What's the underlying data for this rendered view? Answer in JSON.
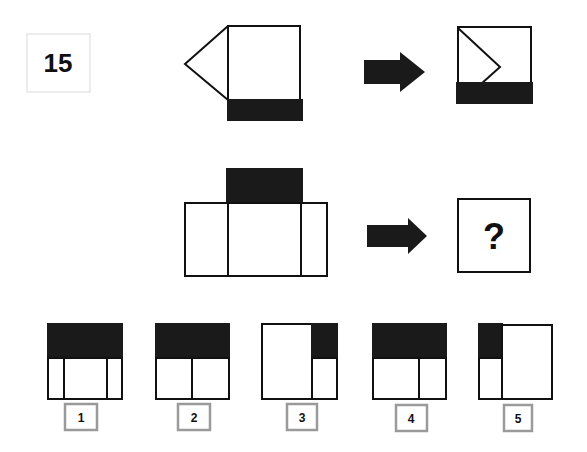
{
  "question": {
    "number": "15"
  },
  "example": {
    "description": "Square with left triangle and black bar below transforms into square with triangle folded inside and black bar below"
  },
  "problem": {
    "missing_symbol": "?"
  },
  "options": [
    {
      "label": "1"
    },
    {
      "label": "2"
    },
    {
      "label": "3"
    },
    {
      "label": "4"
    },
    {
      "label": "5"
    }
  ],
  "colors": {
    "fill_dark": "#1a1a1a",
    "stroke": "#111111",
    "label_border": "#9a9a9a",
    "number_border": "#e6e6e6"
  }
}
